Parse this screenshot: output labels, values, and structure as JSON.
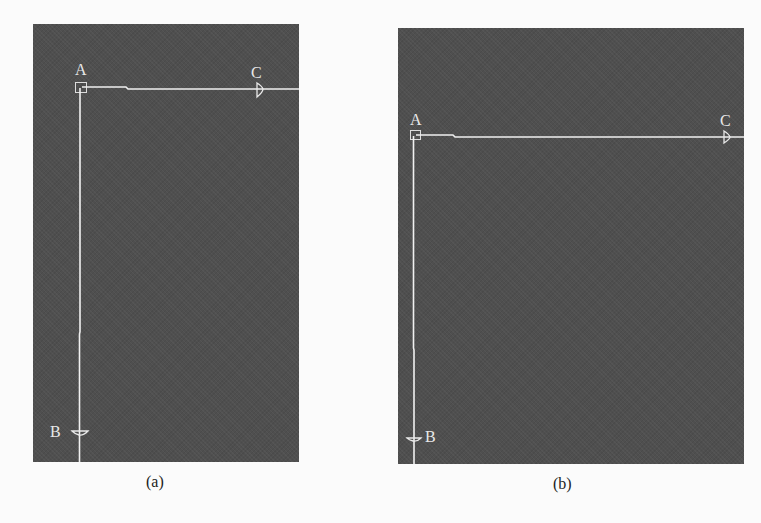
{
  "figure": {
    "panels": [
      {
        "id": "a",
        "caption": "(a)",
        "points": {
          "A": "A",
          "B": "B",
          "C": "C"
        },
        "description": "Corner A with a vertical wire down to B and a horizontal wire right to C"
      },
      {
        "id": "b",
        "caption": "(b)",
        "points": {
          "A": "A",
          "B": "B",
          "C": "C"
        },
        "description": "Same layout, corner A placed lower in the frame, B label on the right of its marker"
      }
    ],
    "colors": {
      "panel_background": "#4f4f4f",
      "line": "#f0f0f0",
      "label": "#e8e8e8",
      "page_background": "#fbfbfb",
      "caption": "#222222"
    }
  }
}
